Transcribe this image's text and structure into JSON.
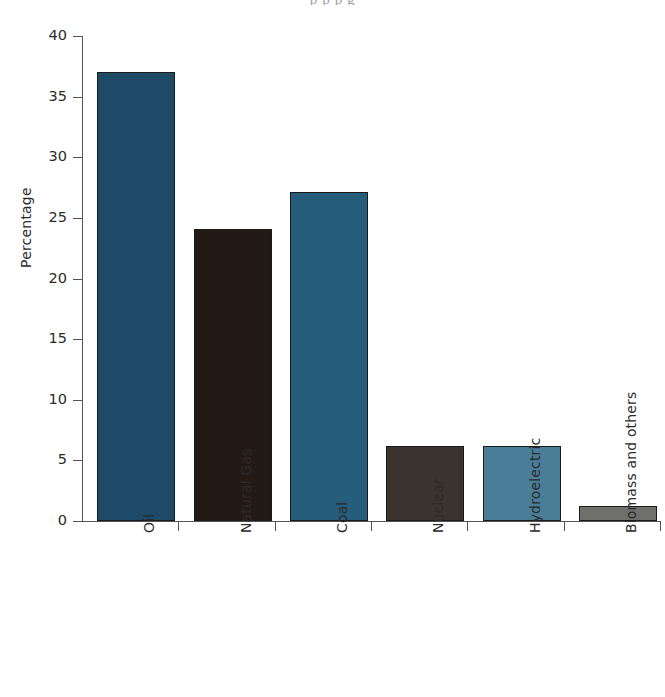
{
  "page": {
    "bleed_text": "p p p g"
  },
  "chart_data": {
    "type": "bar",
    "title": "",
    "xlabel": "",
    "ylabel": "Percentage",
    "ylim": [
      0,
      40
    ],
    "yticks": [
      0,
      5,
      10,
      15,
      20,
      25,
      30,
      35,
      40
    ],
    "ytick_labels": [
      "0",
      "5",
      "10",
      "15",
      "20",
      "25",
      "30",
      "35",
      "40"
    ],
    "grid": false,
    "legend": null,
    "categories": [
      "Oil",
      "Natural Gas",
      "Coal",
      "Nuclear",
      "Hydroelectric",
      "Biomass and others"
    ],
    "values": [
      37.0,
      24.1,
      27.1,
      6.2,
      6.2,
      1.2
    ],
    "colors": [
      "#1d4a66",
      "#241a15",
      "#255d7a",
      "#3b3330",
      "#4a7e98",
      "#6f6f6c"
    ],
    "bar_edge_color": "#1a1a1a"
  }
}
